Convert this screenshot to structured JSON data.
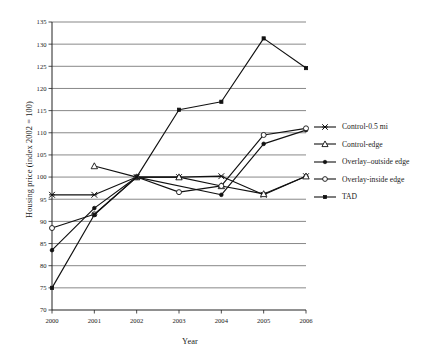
{
  "chart_data": {
    "type": "line",
    "title": "",
    "xlabel": "Year",
    "ylabel": "Housing price (index 2002 = 100)",
    "x": [
      2000,
      2001,
      2002,
      2003,
      2004,
      2005,
      2006
    ],
    "xticklabels": [
      "2000",
      "2001",
      "2002",
      "2003",
      "2004",
      "2005",
      "2006"
    ],
    "ylim": [
      70,
      135
    ],
    "yticks": [
      70,
      75,
      80,
      85,
      90,
      95,
      100,
      105,
      110,
      115,
      120,
      125,
      130,
      135
    ],
    "yticklabels": [
      "70",
      "75",
      "80",
      "85",
      "90",
      "95",
      "100",
      "105",
      "110",
      "115",
      "120",
      "125",
      "130",
      "135"
    ],
    "grid": true,
    "grid_axis": "y",
    "legend_position": "right",
    "series": [
      {
        "name": "Control-0.5 mi",
        "marker": "x-cross",
        "values": [
          96.0,
          96.0,
          100.0,
          100.0,
          100.2,
          96.0,
          100.2
        ]
      },
      {
        "name": "Control-edge",
        "marker": "open-triangle",
        "values": [
          null,
          102.5,
          100.0,
          100.0,
          98.0,
          96.2,
          100.2
        ]
      },
      {
        "name": "Overlay–outside edge",
        "marker": "filled-circle",
        "values": [
          83.5,
          93.0,
          100.0,
          null,
          96.0,
          107.5,
          110.6
        ]
      },
      {
        "name": "Overlay-inside edge",
        "marker": "open-circle",
        "values": [
          88.5,
          91.6,
          100.0,
          96.6,
          98.0,
          109.5,
          111.0
        ]
      },
      {
        "name": "TAD",
        "marker": "filled-square",
        "values": [
          75.0,
          91.5,
          100.0,
          115.2,
          117.0,
          131.3,
          124.6
        ]
      }
    ]
  },
  "legend": {
    "items": [
      {
        "label": "Control-0.5 mi"
      },
      {
        "label": "Control-edge"
      },
      {
        "label": "Overlay–outside edge"
      },
      {
        "label": "Overlay-inside edge"
      },
      {
        "label": "TAD"
      }
    ]
  },
  "axes": {
    "xlabel": "Year",
    "ylabel": "Housing price (index 2002 = 100)"
  }
}
